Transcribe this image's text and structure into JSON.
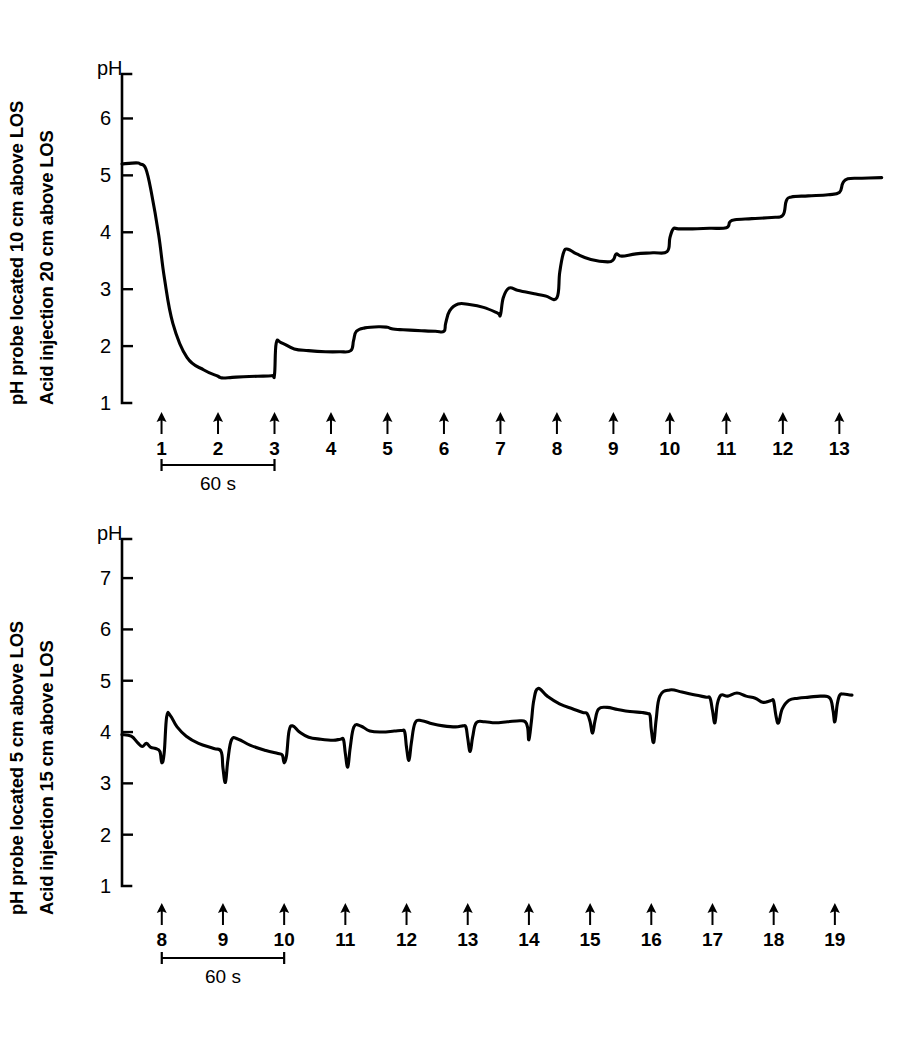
{
  "figure": {
    "background": "#ffffff",
    "ink_color": "#000000",
    "width": 912,
    "height": 1046
  },
  "panels": [
    {
      "id": "top",
      "caption_line1": "pH probe located 10 cm above LOS",
      "caption_line2": "Acid injection 20 cm above LOS",
      "axis_title": "pH",
      "tick_labels": [
        "6",
        "5",
        "4",
        "3",
        "2",
        "1"
      ],
      "scalebar_label": "60 s",
      "marker_labels": [
        "1",
        "2",
        "3",
        "4",
        "5",
        "6",
        "7",
        "8",
        "9",
        "10",
        "11",
        "12",
        "13"
      ]
    },
    {
      "id": "bottom",
      "caption_line1": "pH probe located 5 cm above LOS",
      "caption_line2": "Acid injection 15 cm above LOS",
      "axis_title": "pH",
      "tick_labels": [
        "7",
        "6",
        "5",
        "4",
        "3",
        "2",
        "1"
      ],
      "scalebar_label": "60 s",
      "marker_labels": [
        "8",
        "9",
        "10",
        "11",
        "12",
        "13",
        "14",
        "15",
        "16",
        "17",
        "18",
        "19"
      ]
    }
  ],
  "chart_data": [
    {
      "type": "line",
      "id": "top-panel-ph-trace",
      "title": "pH probe located 10 cm above LOS / Acid injection 20 cm above LOS",
      "xlabel": "Acid injection number (arrows), time scale bar = 60 s",
      "ylabel": "pH",
      "ylim": [
        1,
        6.6
      ],
      "yticks": [
        1,
        2,
        3,
        4,
        5,
        6
      ],
      "grid": false,
      "legend": "none",
      "xunit": "injection index",
      "scalebar_seconds": 60,
      "scalebar_spans_injections": [
        "1",
        "3"
      ],
      "injection_markers": [
        {
          "label": "1",
          "x": 1.0
        },
        {
          "label": "2",
          "x": 2.0
        },
        {
          "label": "3",
          "x": 3.0
        },
        {
          "label": "4",
          "x": 4.0
        },
        {
          "label": "5",
          "x": 5.0
        },
        {
          "label": "6",
          "x": 6.0
        },
        {
          "label": "7",
          "x": 7.0
        },
        {
          "label": "8",
          "x": 8.0
        },
        {
          "label": "9",
          "x": 9.0
        },
        {
          "label": "10",
          "x": 10.0
        },
        {
          "label": "11",
          "x": 11.0
        },
        {
          "label": "12",
          "x": 12.0
        },
        {
          "label": "13",
          "x": 13.0
        }
      ],
      "baseline_ph": 5.2,
      "nadir_ph": 1.45,
      "final_ph": 4.95,
      "x": [
        0.3,
        0.55,
        0.62,
        0.72,
        0.82,
        0.95,
        1.05,
        1.2,
        1.45,
        1.75,
        2.0,
        2.03,
        2.1,
        2.25,
        2.45,
        2.7,
        2.95,
        3.0,
        3.03,
        3.12,
        3.35,
        3.6,
        3.9,
        4.15,
        4.35,
        4.4,
        4.45,
        4.6,
        4.85,
        5.0,
        5.03,
        5.1,
        5.22,
        5.4,
        5.6,
        5.85,
        6.0,
        6.03,
        6.1,
        6.25,
        6.45,
        6.7,
        6.95,
        7.0,
        7.05,
        7.15,
        7.3,
        7.45,
        7.6,
        7.8,
        8.0,
        8.05,
        8.12,
        8.2,
        8.35,
        8.6,
        8.9,
        9.0,
        9.05,
        9.15,
        9.4,
        9.7,
        9.95,
        10.0,
        10.06,
        10.15,
        10.4,
        10.7,
        11.0,
        11.06,
        11.15,
        11.45,
        11.8,
        12.0,
        12.06,
        12.15,
        12.45,
        12.8,
        13.0,
        13.06,
        13.15,
        13.4,
        13.75
      ],
      "y": [
        5.2,
        5.22,
        5.2,
        5.12,
        4.7,
        3.95,
        3.2,
        2.4,
        1.8,
        1.58,
        1.47,
        1.45,
        1.44,
        1.45,
        1.46,
        1.47,
        1.48,
        1.5,
        2.05,
        2.06,
        1.95,
        1.92,
        1.9,
        1.9,
        1.92,
        2.1,
        2.26,
        2.32,
        2.34,
        2.33,
        2.32,
        2.3,
        2.29,
        2.28,
        2.27,
        2.26,
        2.26,
        2.4,
        2.62,
        2.74,
        2.73,
        2.68,
        2.58,
        2.55,
        2.85,
        3.02,
        2.98,
        2.95,
        2.92,
        2.88,
        2.85,
        3.3,
        3.65,
        3.7,
        3.62,
        3.52,
        3.48,
        3.52,
        3.62,
        3.58,
        3.62,
        3.64,
        3.66,
        3.9,
        4.06,
        4.06,
        4.06,
        4.07,
        4.08,
        4.18,
        4.22,
        4.24,
        4.26,
        4.3,
        4.55,
        4.62,
        4.64,
        4.66,
        4.7,
        4.86,
        4.94,
        4.95,
        4.96
      ]
    },
    {
      "type": "line",
      "id": "bottom-panel-ph-trace",
      "title": "pH probe located 5 cm above LOS / Acid injection 15 cm above LOS",
      "xlabel": "Acid injection number (arrows), time scale bar = 60 s",
      "ylabel": "pH",
      "ylim": [
        1,
        7.6
      ],
      "yticks": [
        1,
        2,
        3,
        4,
        5,
        6,
        7
      ],
      "grid": false,
      "legend": "none",
      "xunit": "injection index",
      "scalebar_seconds": 60,
      "scalebar_spans_injections": [
        "8",
        "10"
      ],
      "injection_markers": [
        {
          "label": "8",
          "x": 8.0
        },
        {
          "label": "9",
          "x": 9.0
        },
        {
          "label": "10",
          "x": 10.0
        },
        {
          "label": "11",
          "x": 11.0
        },
        {
          "label": "12",
          "x": 12.0
        },
        {
          "label": "13",
          "x": 13.0
        },
        {
          "label": "14",
          "x": 14.0
        },
        {
          "label": "15",
          "x": 15.0
        },
        {
          "label": "16",
          "x": 16.0
        },
        {
          "label": "17",
          "x": 17.0
        },
        {
          "label": "18",
          "x": 18.0
        },
        {
          "label": "19",
          "x": 19.0
        }
      ],
      "baseline_ph": 3.95,
      "peak_ph": 4.85,
      "nadir_ph": 3.0,
      "final_ph": 4.72,
      "x": [
        7.35,
        7.5,
        7.6,
        7.68,
        7.75,
        7.82,
        7.9,
        7.97,
        8.0,
        8.04,
        8.08,
        8.14,
        8.25,
        8.4,
        8.6,
        8.85,
        8.97,
        9.0,
        9.04,
        9.08,
        9.14,
        9.25,
        9.45,
        9.7,
        9.9,
        9.97,
        10.0,
        10.04,
        10.08,
        10.14,
        10.25,
        10.4,
        10.6,
        10.8,
        10.92,
        10.97,
        11.0,
        11.04,
        11.08,
        11.14,
        11.25,
        11.4,
        11.6,
        11.8,
        11.92,
        11.97,
        12.0,
        12.04,
        12.08,
        12.14,
        12.25,
        12.42,
        12.6,
        12.8,
        12.92,
        12.97,
        13.0,
        13.04,
        13.08,
        13.14,
        13.28,
        13.45,
        13.65,
        13.85,
        13.94,
        13.98,
        14.0,
        14.04,
        14.08,
        14.15,
        14.3,
        14.5,
        14.72,
        14.88,
        14.95,
        15.0,
        15.04,
        15.08,
        15.14,
        15.28,
        15.45,
        15.65,
        15.85,
        15.94,
        15.98,
        16.0,
        16.04,
        16.08,
        16.14,
        16.3,
        16.5,
        16.72,
        16.9,
        16.96,
        17.0,
        17.04,
        17.08,
        17.14,
        17.25,
        17.4,
        17.55,
        17.7,
        17.82,
        17.92,
        17.97,
        18.0,
        18.04,
        18.08,
        18.14,
        18.25,
        18.4,
        18.58,
        18.78,
        18.92,
        18.97,
        19.0,
        19.04,
        19.08,
        19.14,
        19.28,
        19.45,
        19.65,
        19.85
      ],
      "y": [
        3.95,
        3.92,
        3.8,
        3.72,
        3.78,
        3.7,
        3.68,
        3.62,
        3.4,
        3.6,
        4.3,
        4.32,
        4.1,
        3.92,
        3.78,
        3.68,
        3.62,
        3.3,
        3.02,
        3.45,
        3.85,
        3.86,
        3.74,
        3.64,
        3.58,
        3.55,
        3.4,
        3.55,
        4.02,
        4.12,
        4.0,
        3.9,
        3.86,
        3.84,
        3.86,
        3.85,
        3.58,
        3.32,
        3.7,
        4.1,
        4.12,
        4.02,
        4.0,
        4.02,
        4.03,
        4.0,
        3.7,
        3.45,
        3.8,
        4.18,
        4.22,
        4.16,
        4.12,
        4.1,
        4.12,
        4.1,
        3.88,
        3.62,
        3.9,
        4.18,
        4.2,
        4.18,
        4.2,
        4.22,
        4.2,
        4.08,
        3.85,
        4.2,
        4.62,
        4.85,
        4.7,
        4.55,
        4.45,
        4.38,
        4.36,
        4.2,
        3.98,
        4.22,
        4.45,
        4.48,
        4.44,
        4.4,
        4.38,
        4.36,
        4.32,
        4.05,
        3.8,
        4.25,
        4.7,
        4.82,
        4.78,
        4.72,
        4.68,
        4.66,
        4.42,
        4.18,
        4.55,
        4.72,
        4.7,
        4.76,
        4.7,
        4.66,
        4.58,
        4.6,
        4.62,
        4.6,
        4.3,
        4.18,
        4.45,
        4.62,
        4.66,
        4.68,
        4.7,
        4.66,
        4.42,
        4.2,
        4.55,
        4.72,
        4.74,
        4.72,
        4.72
      ]
    }
  ]
}
